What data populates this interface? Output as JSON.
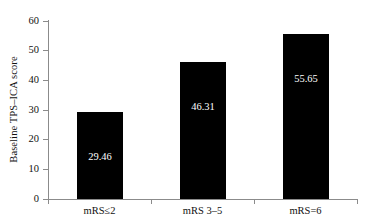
{
  "chart_data": {
    "type": "bar",
    "title": "",
    "subtitle": "",
    "xlabel": "",
    "ylabel": "Baseline TPS–ICA score",
    "categories": [
      "mRS≤2",
      "mRS 3–5",
      "mRS=6"
    ],
    "values": [
      29.46,
      46.31,
      55.65
    ],
    "value_labels": [
      "29.46",
      "46.31",
      "55.65"
    ],
    "ylim": [
      0,
      60
    ],
    "ytick_labels": [
      "0",
      "10",
      "20",
      "30",
      "40",
      "50",
      "60"
    ],
    "ytick_values": [
      0,
      10,
      20,
      30,
      40,
      50,
      60
    ],
    "grid": false,
    "legend": null,
    "bar_color": "#000000",
    "value_label_color": "#ffffff",
    "axis_color": "#8b8b8b",
    "background_color": "#ffffff"
  }
}
